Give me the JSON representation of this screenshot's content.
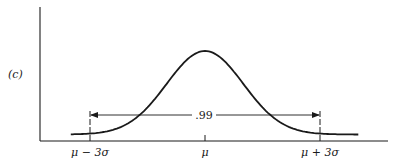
{
  "panel_label": "(c)",
  "chart_data": {
    "type": "line",
    "title": "",
    "xlabel": "",
    "ylabel": "",
    "x_ticks": [
      {
        "label": "μ − 3σ",
        "value": -3
      },
      {
        "label": "μ",
        "value": 0
      },
      {
        "label": "μ + 3σ",
        "value": 3
      }
    ],
    "x_range_sigma": [
      -3.5,
      4.0
    ],
    "series": [
      {
        "name": "normal density",
        "shape": "bell",
        "mean": 0,
        "sd": 1
      }
    ],
    "annotations": [
      {
        "type": "double-arrow",
        "from": -3,
        "to": 3,
        "label": ".99"
      }
    ],
    "grid": false,
    "legend": null
  },
  "colors": {
    "ink": "#1a1a1a",
    "background": "#ffffff"
  }
}
